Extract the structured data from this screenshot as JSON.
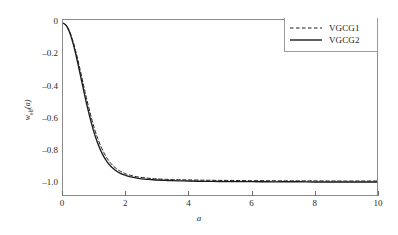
{
  "chart_data": {
    "type": "line",
    "title": "",
    "xlabel": "a",
    "ylabel_main": "w",
    "ylabel_sub": "eff",
    "ylabel_suffix": "(a)",
    "xlim": [
      0,
      10
    ],
    "ylim": [
      -1.08,
      0.02
    ],
    "xticks": [
      0,
      2,
      4,
      6,
      8,
      10
    ],
    "xtick_labels": [
      "0",
      "2",
      "4",
      "6",
      "8",
      "10"
    ],
    "yticks": [
      0,
      -0.2,
      -0.4,
      -0.6,
      -0.8,
      -1.0
    ],
    "ytick_labels": [
      "0",
      "–0.2",
      "–0.4",
      "–0.6",
      "–0.8",
      "–1.0"
    ],
    "grid": false,
    "legend_position": "top-right",
    "line_color": "#1a1a1a",
    "frame_color": "#8a8a8a",
    "background": "#ffffff",
    "series": [
      {
        "name": "VGCG1",
        "style": "dashed",
        "x": [
          0,
          0.1,
          0.2,
          0.3,
          0.4,
          0.5,
          0.6,
          0.7,
          0.8,
          0.9,
          1.0,
          1.1,
          1.2,
          1.3,
          1.4,
          1.5,
          1.6,
          1.7,
          1.8,
          1.9,
          2.0,
          2.2,
          2.4,
          2.6,
          2.8,
          3.0,
          3.25,
          3.5,
          3.75,
          4.0,
          4.5,
          5.0,
          5.5,
          6.0,
          6.5,
          7.0,
          7.5,
          8.0,
          8.5,
          9.0,
          9.5,
          10.0
        ],
        "y": [
          0.0,
          -0.012,
          -0.047,
          -0.101,
          -0.171,
          -0.253,
          -0.341,
          -0.429,
          -0.514,
          -0.592,
          -0.662,
          -0.722,
          -0.772,
          -0.814,
          -0.848,
          -0.875,
          -0.897,
          -0.914,
          -0.928,
          -0.938,
          -0.947,
          -0.959,
          -0.967,
          -0.972,
          -0.976,
          -0.979,
          -0.981,
          -0.983,
          -0.984,
          -0.985,
          -0.987,
          -0.988,
          -0.989,
          -0.99,
          -0.99,
          -0.991,
          -0.991,
          -0.991,
          -0.992,
          -0.992,
          -0.992,
          -0.992
        ]
      },
      {
        "name": "VGCG2",
        "style": "solid",
        "x": [
          0,
          0.1,
          0.2,
          0.3,
          0.4,
          0.5,
          0.6,
          0.7,
          0.8,
          0.9,
          1.0,
          1.1,
          1.2,
          1.3,
          1.4,
          1.5,
          1.6,
          1.7,
          1.8,
          1.9,
          2.0,
          2.2,
          2.4,
          2.6,
          2.8,
          3.0,
          3.25,
          3.5,
          3.75,
          4.0,
          4.5,
          5.0,
          5.5,
          6.0,
          6.5,
          7.0,
          7.5,
          8.0,
          8.5,
          9.0,
          9.5,
          10.0
        ],
        "y": [
          0.0,
          -0.014,
          -0.053,
          -0.113,
          -0.189,
          -0.277,
          -0.37,
          -0.461,
          -0.547,
          -0.625,
          -0.694,
          -0.752,
          -0.8,
          -0.839,
          -0.87,
          -0.895,
          -0.914,
          -0.929,
          -0.941,
          -0.95,
          -0.957,
          -0.968,
          -0.975,
          -0.98,
          -0.983,
          -0.986,
          -0.988,
          -0.99,
          -0.991,
          -0.992,
          -0.994,
          -0.995,
          -0.996,
          -0.996,
          -0.997,
          -0.997,
          -0.997,
          -0.998,
          -0.998,
          -0.998,
          -0.998,
          -0.998
        ]
      }
    ]
  },
  "legend": {
    "items": [
      {
        "label": "VGCG1",
        "style": "dashed"
      },
      {
        "label": "VGCG2",
        "style": "solid"
      }
    ]
  }
}
